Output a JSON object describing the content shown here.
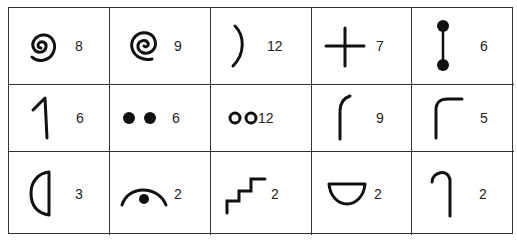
{
  "grid": {
    "rows": 3,
    "columns": 5,
    "cells": [
      {
        "symbol": "spiral-counterclockwise-icon",
        "count": "8"
      },
      {
        "symbol": "spiral-clockwise-icon",
        "count": "9"
      },
      {
        "symbol": "right-parenthesis-arc-icon",
        "count": "12"
      },
      {
        "symbol": "plus-cross-icon",
        "count": "7"
      },
      {
        "symbol": "dumbbell-vertical-icon",
        "count": "6"
      },
      {
        "symbol": "angled-one-stroke-icon",
        "count": "6"
      },
      {
        "symbol": "two-filled-dots-icon",
        "count": "6"
      },
      {
        "symbol": "two-hollow-circles-icon",
        "count": "12"
      },
      {
        "symbol": "curved-hook-left-icon",
        "count": "9"
      },
      {
        "symbol": "corner-bend-icon",
        "count": "5"
      },
      {
        "symbol": "half-circle-left-icon",
        "count": "3"
      },
      {
        "symbol": "arc-with-dot-icon",
        "count": "2"
      },
      {
        "symbol": "staircase-icon",
        "count": "2"
      },
      {
        "symbol": "bowl-half-circle-icon",
        "count": "2"
      },
      {
        "symbol": "hook-cane-icon",
        "count": "2"
      }
    ]
  }
}
